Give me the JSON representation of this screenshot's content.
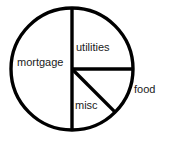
{
  "chart_data": {
    "type": "pie",
    "title": "",
    "subtitle": "",
    "xlabel": "",
    "ylabel": "",
    "legend": "none",
    "grid": false,
    "labels_position": "inside-and-outside",
    "stroke_color": "#000000",
    "fill_color": "#ffffff",
    "categories": [
      "mortgage",
      "utilities",
      "food",
      "misc"
    ],
    "values": [
      50,
      25,
      12.5,
      12.5
    ],
    "units": "percent",
    "slices": [
      {
        "name": "mortgage",
        "label": "mortgage",
        "value": 50,
        "start_angle_deg": 0,
        "end_angle_deg": 180,
        "sweep_deg": 180,
        "label_placement": "inside",
        "fill": "#ffffff"
      },
      {
        "name": "utilities",
        "label": "utilities",
        "value": 25,
        "start_angle_deg": 270,
        "end_angle_deg": 360,
        "sweep_deg": 90,
        "label_placement": "inside",
        "fill": "#ffffff"
      },
      {
        "name": "food",
        "label": "food",
        "value": 12.5,
        "start_angle_deg": 0,
        "end_angle_deg": 45,
        "sweep_deg": 45,
        "label_placement": "outside",
        "fill": "#ffffff"
      },
      {
        "name": "misc",
        "label": "misc",
        "value": 12.5,
        "start_angle_deg": 45,
        "end_angle_deg": 90,
        "sweep_deg": 45,
        "label_placement": "inside",
        "fill": "#ffffff"
      }
    ],
    "geometry": {
      "center_x": 72,
      "center_y": 69,
      "radius": 61
    }
  }
}
